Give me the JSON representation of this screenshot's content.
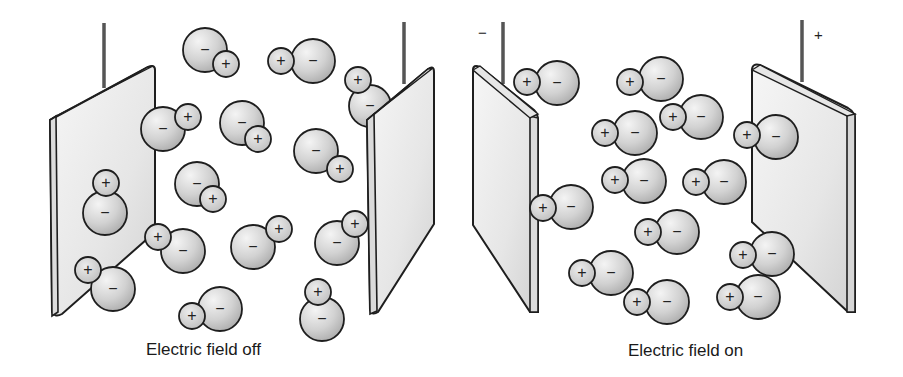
{
  "panels": [
    {
      "id": "field-off",
      "caption": "Electric field off",
      "terminal_labels": [],
      "molecules": [
        {
          "neg": {
            "x": 205,
            "y": 50,
            "r": 22
          },
          "pos": {
            "x": 226,
            "y": 64,
            "r": 13
          }
        },
        {
          "neg": {
            "x": 313,
            "y": 61,
            "r": 22
          },
          "pos": {
            "x": 281,
            "y": 61,
            "r": 13
          }
        },
        {
          "neg": {
            "x": 370,
            "y": 106,
            "r": 21
          },
          "pos": {
            "x": 358,
            "y": 80,
            "r": 13
          }
        },
        {
          "neg": {
            "x": 163,
            "y": 129,
            "r": 22
          },
          "pos": {
            "x": 188,
            "y": 117,
            "r": 13
          }
        },
        {
          "neg": {
            "x": 242,
            "y": 123,
            "r": 22
          },
          "pos": {
            "x": 258,
            "y": 139,
            "r": 13
          }
        },
        {
          "neg": {
            "x": 316,
            "y": 151,
            "r": 22
          },
          "pos": {
            "x": 340,
            "y": 169,
            "r": 13
          }
        },
        {
          "neg": {
            "x": 105,
            "y": 213,
            "r": 22
          },
          "pos": {
            "x": 106,
            "y": 183,
            "r": 13
          }
        },
        {
          "neg": {
            "x": 197,
            "y": 184,
            "r": 22
          },
          "pos": {
            "x": 213,
            "y": 199,
            "r": 13
          }
        },
        {
          "neg": {
            "x": 183,
            "y": 251,
            "r": 22
          },
          "pos": {
            "x": 158,
            "y": 237,
            "r": 13
          }
        },
        {
          "neg": {
            "x": 253,
            "y": 247,
            "r": 22
          },
          "pos": {
            "x": 279,
            "y": 229,
            "r": 13
          }
        },
        {
          "neg": {
            "x": 337,
            "y": 243,
            "r": 22
          },
          "pos": {
            "x": 355,
            "y": 224,
            "r": 13
          }
        },
        {
          "neg": {
            "x": 113,
            "y": 289,
            "r": 22
          },
          "pos": {
            "x": 88,
            "y": 270,
            "r": 13
          }
        },
        {
          "neg": {
            "x": 220,
            "y": 309,
            "r": 22
          },
          "pos": {
            "x": 192,
            "y": 316,
            "r": 13
          }
        },
        {
          "neg": {
            "x": 322,
            "y": 319,
            "r": 22
          },
          "pos": {
            "x": 318,
            "y": 292,
            "r": 13
          }
        }
      ]
    },
    {
      "id": "field-on",
      "caption": "Electric field on",
      "terminal_labels": [
        "−",
        "+"
      ],
      "molecules": [
        {
          "neg": {
            "x": 557,
            "y": 83,
            "r": 22
          },
          "pos": {
            "x": 527,
            "y": 82,
            "r": 13
          }
        },
        {
          "neg": {
            "x": 661,
            "y": 79,
            "r": 22
          },
          "pos": {
            "x": 630,
            "y": 82,
            "r": 13
          }
        },
        {
          "neg": {
            "x": 701,
            "y": 117,
            "r": 22
          },
          "pos": {
            "x": 673,
            "y": 117,
            "r": 13
          }
        },
        {
          "neg": {
            "x": 635,
            "y": 133,
            "r": 22
          },
          "pos": {
            "x": 605,
            "y": 133,
            "r": 13
          }
        },
        {
          "neg": {
            "x": 776,
            "y": 137,
            "r": 22
          },
          "pos": {
            "x": 747,
            "y": 135,
            "r": 13
          }
        },
        {
          "neg": {
            "x": 644,
            "y": 181,
            "r": 22
          },
          "pos": {
            "x": 615,
            "y": 180,
            "r": 13
          }
        },
        {
          "neg": {
            "x": 724,
            "y": 182,
            "r": 22
          },
          "pos": {
            "x": 696,
            "y": 182,
            "r": 13
          }
        },
        {
          "neg": {
            "x": 571,
            "y": 207,
            "r": 22
          },
          "pos": {
            "x": 543,
            "y": 208,
            "r": 13
          }
        },
        {
          "neg": {
            "x": 677,
            "y": 232,
            "r": 22
          },
          "pos": {
            "x": 648,
            "y": 232,
            "r": 13
          }
        },
        {
          "neg": {
            "x": 772,
            "y": 254,
            "r": 22
          },
          "pos": {
            "x": 743,
            "y": 255,
            "r": 13
          }
        },
        {
          "neg": {
            "x": 611,
            "y": 273,
            "r": 22
          },
          "pos": {
            "x": 582,
            "y": 273,
            "r": 13
          }
        },
        {
          "neg": {
            "x": 667,
            "y": 302,
            "r": 22
          },
          "pos": {
            "x": 637,
            "y": 302,
            "r": 13
          }
        },
        {
          "neg": {
            "x": 758,
            "y": 297,
            "r": 22
          },
          "pos": {
            "x": 730,
            "y": 297,
            "r": 13
          }
        }
      ]
    }
  ],
  "symbols": {
    "positive": "+",
    "negative": "−"
  },
  "colors": {
    "outline": "#1e1e1e",
    "neg_fill": "#cfcfcf",
    "pos_fill": "#d8d8d8",
    "plate_fill": "#ededed",
    "wire": "#555555",
    "background": "#ffffff"
  }
}
